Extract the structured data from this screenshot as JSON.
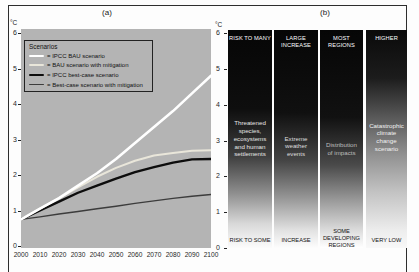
{
  "figure": {
    "panel_a": {
      "title": "(a)",
      "unit": "°C",
      "legend": {
        "title": "Scenarios",
        "entries": [
          {
            "label": "= IPCC BAU scenario"
          },
          {
            "label": "= BAU scenario with mitigation"
          },
          {
            "label": "= IPCC best-case scenario"
          },
          {
            "label": "= Best-case scenario with mitigation"
          }
        ]
      }
    },
    "panel_b": {
      "title": "(b)",
      "unit": "°C"
    }
  },
  "colors": {
    "plot_background": "#b4b4b4",
    "page_background": "#fdfdfd",
    "frame_border": "#2e2e2e",
    "axis_text": "#1f1f1f"
  },
  "chart_data": [
    {
      "type": "line",
      "title": "(a)",
      "xlabel": "",
      "ylabel": "°C",
      "xlim": [
        2000,
        2100
      ],
      "ylim": [
        0,
        6
      ],
      "grid": false,
      "legend_position": "upper left",
      "plot_bg": "#b4b4b4",
      "x": [
        2000,
        2010,
        2020,
        2030,
        2040,
        2050,
        2060,
        2070,
        2080,
        2090,
        2100
      ],
      "x_ticks": [
        2000,
        2010,
        2020,
        2030,
        2040,
        2050,
        2060,
        2070,
        2080,
        2090,
        2100
      ],
      "y_ticks": [
        6,
        5,
        4,
        3,
        2,
        1,
        0
      ],
      "series": [
        {
          "name": "IPCC BAU scenario",
          "color": "#ffffff",
          "width": 2.6,
          "values": [
            0.75,
            1.05,
            1.35,
            1.7,
            2.05,
            2.45,
            2.9,
            3.35,
            3.8,
            4.3,
            4.8
          ]
        },
        {
          "name": "BAU scenario with mitigation",
          "color": "#e9e6da",
          "width": 2.0,
          "values": [
            0.75,
            1.05,
            1.35,
            1.65,
            1.95,
            2.2,
            2.4,
            2.55,
            2.62,
            2.68,
            2.7
          ]
        },
        {
          "name": "IPCC best-case scenario",
          "color": "#0d0d0d",
          "width": 2.4,
          "values": [
            0.75,
            1.0,
            1.25,
            1.5,
            1.7,
            1.9,
            2.08,
            2.22,
            2.35,
            2.44,
            2.45
          ]
        },
        {
          "name": "Best-case scenario with mitigation",
          "color": "#3c3c3c",
          "width": 1.4,
          "values": [
            0.75,
            0.82,
            0.9,
            0.97,
            1.05,
            1.12,
            1.2,
            1.27,
            1.34,
            1.4,
            1.45
          ]
        }
      ]
    },
    {
      "type": "heatmap",
      "title": "(b)",
      "ylabel": "°C",
      "ylim": [
        0,
        6
      ],
      "y_ticks": [
        6,
        5,
        4,
        3,
        2,
        1,
        0
      ],
      "note": "burning-embers risk columns; shading runs from near-white (low risk) at bottom (~0°C) to black (high risk) toward the top; column 4 transitions higher up the scale",
      "columns": [
        {
          "top_label": "RISK TO MANY",
          "body": "Threatened\nspecies,\necosystems\nand human\nsettlements",
          "bottom_label": "RISK TO SOME",
          "body_color": "#e6e6e6",
          "gradient": [
            "#060606 0%",
            "#0e0e0e 36%",
            "#3f3f3f 58%",
            "#8f8f8f 75%",
            "#d9d9d9 89%",
            "#fcfcfc 100%"
          ]
        },
        {
          "top_label": "LARGE\nINCREASE",
          "body": "Extreme\nweather\nevents",
          "bottom_label": "INCREASE",
          "body_color": "#dedede",
          "gradient": [
            "#060606 0%",
            "#101010 38%",
            "#454545 60%",
            "#969696 77%",
            "#e2e2e2 92%",
            "#fdfdfd 100%"
          ]
        },
        {
          "top_label": "MOST\nREGIONS",
          "body": "Distribution\nof impacts",
          "bottom_label": "SOME\nDEVELOPING\nREGIONS",
          "body_color": "#bdbdbd",
          "gradient": [
            "#060606 0%",
            "#111111 40%",
            "#4a4a4a 62%",
            "#9e9e9e 79%",
            "#e6e6e6 94%",
            "#ffffff 100%"
          ]
        },
        {
          "top_label": "HIGHER",
          "body": "Catastrophic\nclimate\nchange\nscenario",
          "bottom_label": "VERY LOW",
          "body_color": "#f2f2f2",
          "gradient": [
            "#0a0a0a 0%",
            "#1c1c1c 22%",
            "#5f5f5f 42%",
            "#939393 58%",
            "#c2c2c2 74%",
            "#ededed 92%",
            "#f8f8f8 100%"
          ]
        }
      ]
    }
  ]
}
